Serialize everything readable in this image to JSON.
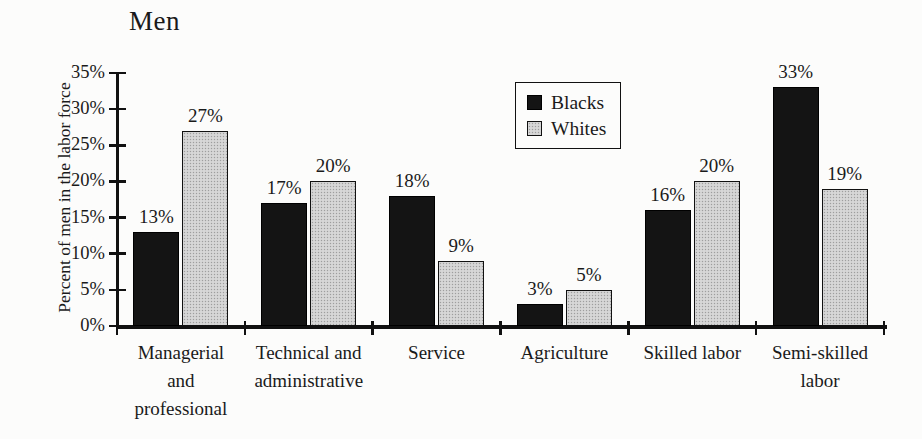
{
  "chart_data": {
    "type": "bar",
    "title": "Men",
    "ylabel": "Percent of men in the labor force",
    "categories": [
      "Managerial and professional",
      "Technical and administrative",
      "Service",
      "Agriculture",
      "Skilled labor",
      "Semi-skilled labor"
    ],
    "categories_display": [
      [
        "Managerial",
        "and",
        "professional"
      ],
      [
        "Technical and",
        "administrative"
      ],
      [
        "Service"
      ],
      [
        "Agriculture"
      ],
      [
        "Skilled labor"
      ],
      [
        "Semi-skilled",
        "labor"
      ]
    ],
    "series": [
      {
        "name": "Blacks",
        "values": [
          13,
          17,
          18,
          3,
          16,
          33
        ],
        "color": "#141414"
      },
      {
        "name": "Whites",
        "values": [
          27,
          20,
          9,
          5,
          20,
          19
        ],
        "color": "#d7d7d7"
      }
    ],
    "value_label_suffix": "%",
    "ytick_labels": [
      "0%",
      "5%",
      "10%",
      "15%",
      "20%",
      "25%",
      "30%",
      "35%"
    ],
    "ylim": [
      0,
      35
    ],
    "grid": false,
    "legend": {
      "position": "top-center",
      "items": [
        "Blacks",
        "Whites"
      ]
    },
    "colors": {
      "axis": "#111111",
      "text": "#1a1a1a",
      "background": "#fcfcfb"
    }
  }
}
